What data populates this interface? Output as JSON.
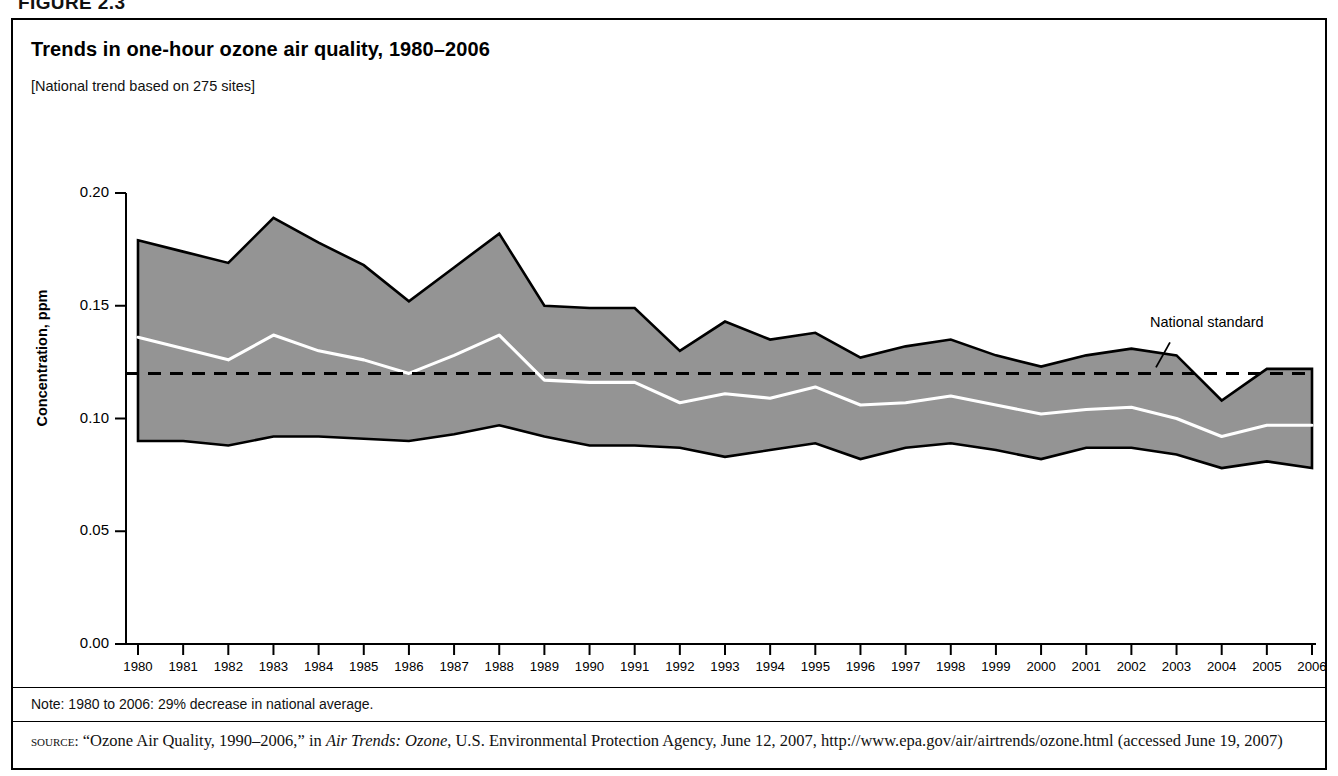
{
  "figure": {
    "label": "FIGURE 2.3"
  },
  "chart": {
    "title": "Trends in one-hour ozone air quality, 1980–2006",
    "subtitle": "[National trend based on 275 sites]",
    "note": "Note: 1980 to 2006: 29% decrease in national average.",
    "source_prefix": "source:",
    "source_text_1": " “Ozone Air Quality, 1990–2006,” in ",
    "source_italic": "Air Trends: Ozone",
    "source_text_2": ", U.S. Environmental Protection Agency, June 12, 2007, http://www.epa.gov/air/airtrends/ozone.html (accessed June 19, 2007)",
    "annotation_standard": "National standard"
  },
  "chart_data": {
    "type": "area",
    "title": "Trends in one-hour ozone air quality, 1980–2006",
    "subtitle": "[National trend based on 275 sites]",
    "xlabel": "",
    "ylabel": "Concentration, ppm",
    "ylim": [
      0.0,
      0.2
    ],
    "xlim": [
      1980,
      2006
    ],
    "ytick_labels": [
      "0.00",
      "0.05",
      "0.10",
      "0.15",
      "0.20"
    ],
    "ytick_values": [
      0.0,
      0.05,
      0.1,
      0.15,
      0.2
    ],
    "grid": false,
    "legend": "none",
    "x": [
      1980,
      1981,
      1982,
      1983,
      1984,
      1985,
      1986,
      1987,
      1988,
      1989,
      1990,
      1991,
      1992,
      1993,
      1994,
      1995,
      1996,
      1997,
      1998,
      1999,
      2000,
      2001,
      2002,
      2003,
      2004,
      2005,
      2006
    ],
    "categories": [
      "1980",
      "1981",
      "1982",
      "1983",
      "1984",
      "1985",
      "1986",
      "1987",
      "1988",
      "1989",
      "1990",
      "1991",
      "1992",
      "1993",
      "1994",
      "1995",
      "1996",
      "1997",
      "1998",
      "1999",
      "2000",
      "2001",
      "2002",
      "2003",
      "2004",
      "2005",
      "2006"
    ],
    "series": [
      {
        "name": "90th percentile",
        "role": "band-upper",
        "values": [
          0.179,
          0.174,
          0.169,
          0.189,
          0.178,
          0.168,
          0.152,
          0.167,
          0.182,
          0.15,
          0.149,
          0.149,
          0.13,
          0.143,
          0.135,
          0.138,
          0.127,
          0.132,
          0.135,
          0.128,
          0.123,
          0.128,
          0.131,
          0.128,
          0.108,
          0.122,
          0.122
        ]
      },
      {
        "name": "National average (mean)",
        "role": "mean-line",
        "values": [
          0.136,
          0.131,
          0.126,
          0.137,
          0.13,
          0.126,
          0.12,
          0.128,
          0.137,
          0.117,
          0.116,
          0.116,
          0.107,
          0.111,
          0.109,
          0.114,
          0.106,
          0.107,
          0.11,
          0.106,
          0.102,
          0.104,
          0.105,
          0.1,
          0.092,
          0.097,
          0.097
        ]
      },
      {
        "name": "10th percentile",
        "role": "band-lower",
        "values": [
          0.09,
          0.09,
          0.088,
          0.092,
          0.092,
          0.091,
          0.09,
          0.093,
          0.097,
          0.092,
          0.088,
          0.088,
          0.087,
          0.083,
          0.086,
          0.089,
          0.082,
          0.087,
          0.089,
          0.086,
          0.082,
          0.087,
          0.087,
          0.084,
          0.078,
          0.081,
          0.078
        ]
      }
    ],
    "reference_line": {
      "label": "National standard",
      "value": 0.12,
      "style": "dashed"
    },
    "colors": {
      "band_fill": "#949494",
      "band_outline": "#000000",
      "mean_line": "#ffffff",
      "reference_line": "#000000",
      "axis": "#000000"
    }
  }
}
